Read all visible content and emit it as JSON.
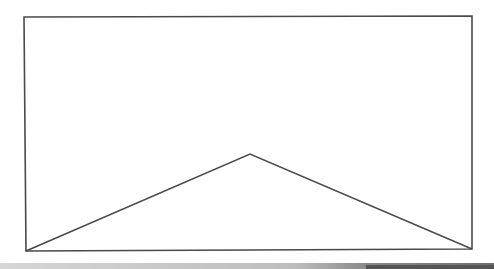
{
  "diagram": {
    "stroke_color": "#4a4a4a",
    "background_color": "#ffffff",
    "rectangle": {
      "top_left": [
        24,
        17
      ],
      "top_right": [
        472,
        16
      ],
      "bottom_right": [
        472,
        249
      ],
      "bottom_left": [
        26,
        251
      ]
    },
    "triangle": {
      "apex": [
        250,
        154
      ],
      "base_left": [
        26,
        251
      ],
      "base_right": [
        472,
        249
      ]
    }
  },
  "bottom_bar": {
    "light_color": "#c8c8c8",
    "dark_color": "#555555"
  }
}
